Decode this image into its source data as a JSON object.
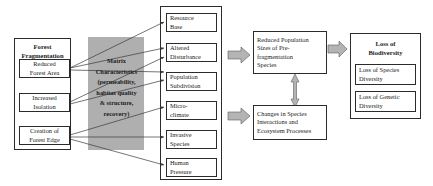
{
  "diagram": {
    "colors": {
      "matrix_band": "#a8a8a8",
      "block_arrow_fill": "#b4b4b4",
      "line": "#3a3a3a",
      "border": "#2b2b2b",
      "background": "#ffffff"
    }
  },
  "left_panel": {
    "title": "Forest\nFragmentation",
    "title_line1": "Forest",
    "title_line2": "Fragmentation",
    "items": [
      {
        "line1": "Reduced",
        "line2": "Forest Area"
      },
      {
        "line1": "Increased",
        "line2": "Isolation"
      },
      {
        "line1": "Creation of",
        "line2": "Forest Edge"
      }
    ]
  },
  "matrix": {
    "lines": [
      "Matrix",
      "Characteristics",
      "(permeability,",
      "habitat quality",
      "& structure,",
      "recovery)"
    ]
  },
  "effects_panel": {
    "items": [
      {
        "line1": "Resource",
        "line2": "Base"
      },
      {
        "line1": "Altered",
        "line2": "Disturbance"
      },
      {
        "line1": "Population",
        "line2": "Subdivision"
      },
      {
        "line1": "Micro-",
        "line2": "climate"
      },
      {
        "line1": "Invasive",
        "line2": "Species"
      },
      {
        "line1": "Human",
        "line2": "Pressure"
      }
    ]
  },
  "outcomes": {
    "reduced_population": {
      "line1": "Reduced Population",
      "line2": "Sizes of Pre-",
      "line3": "fragmentation",
      "line4": "Species"
    },
    "changes_species": {
      "line1": "Changes in Species",
      "line2": "Interactions and",
      "line3": "Ecosystem Processes"
    }
  },
  "biodiversity_panel": {
    "title_line1": "Loss of",
    "title_line2": "Biodiversity",
    "items": [
      {
        "line1": "Loss of Species",
        "line2": "Diversity"
      },
      {
        "line1": "Loss of Genetic",
        "line2": "Diversity"
      }
    ]
  }
}
